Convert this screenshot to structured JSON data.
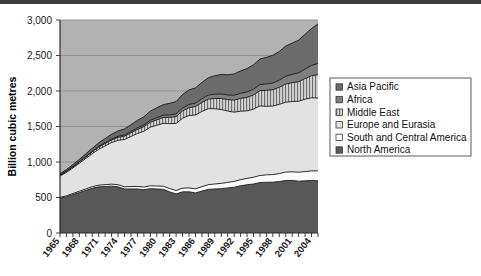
{
  "chart_data": {
    "type": "area",
    "stacked": true,
    "title": "",
    "xlabel": "",
    "ylabel": "Billion cubic metres",
    "ylim": [
      0,
      3000
    ],
    "ytick_labels": [
      "0",
      "500",
      "1,000",
      "1,500",
      "2,000",
      "2,500",
      "3,000"
    ],
    "ytick_values": [
      0,
      500,
      1000,
      1500,
      2000,
      2500,
      3000
    ],
    "grid": true,
    "legend_position": "right",
    "x": [
      1965,
      1966,
      1967,
      1968,
      1969,
      1970,
      1971,
      1972,
      1973,
      1974,
      1975,
      1976,
      1977,
      1978,
      1979,
      1980,
      1981,
      1982,
      1983,
      1984,
      1985,
      1986,
      1987,
      1988,
      1989,
      1990,
      1991,
      1992,
      1993,
      1994,
      1995,
      1996,
      1997,
      1998,
      1999,
      2000,
      2001,
      2002,
      2003,
      2004,
      2005
    ],
    "xtick_labels": [
      "1965",
      "1968",
      "1971",
      "1974",
      "1977",
      "1980",
      "1983",
      "1986",
      "1989",
      "1992",
      "1995",
      "1998",
      "2001",
      "2004"
    ],
    "series": [
      {
        "name": "North America",
        "fill": "#585858",
        "pattern": "solid",
        "values": [
          490,
          510,
          540,
          570,
          600,
          630,
          650,
          655,
          660,
          650,
          620,
          620,
          620,
          610,
          625,
          620,
          615,
          580,
          550,
          580,
          580,
          565,
          590,
          615,
          620,
          625,
          635,
          645,
          665,
          680,
          690,
          710,
          715,
          715,
          725,
          740,
          740,
          730,
          735,
          740,
          735
        ]
      },
      {
        "name": "South and Central America",
        "fill": "#fbfbfb",
        "pattern": "solid",
        "values": [
          12,
          14,
          16,
          18,
          20,
          22,
          24,
          26,
          28,
          30,
          32,
          34,
          36,
          38,
          40,
          42,
          44,
          46,
          48,
          52,
          55,
          58,
          62,
          66,
          70,
          74,
          78,
          82,
          86,
          90,
          95,
          100,
          104,
          108,
          112,
          118,
          122,
          126,
          130,
          135,
          140
        ]
      },
      {
        "name": "Europe and Eurasia",
        "fill": "#e2e2e2",
        "pattern": "solid",
        "values": [
          300,
          330,
          360,
          395,
          430,
          465,
          505,
          545,
          585,
          625,
          665,
          705,
          745,
          785,
          825,
          855,
          885,
          915,
          945,
          985,
          1020,
          1040,
          1060,
          1070,
          1060,
          1040,
          1005,
          975,
          965,
          950,
          960,
          980,
          965,
          965,
          975,
          985,
          990,
          1000,
          1020,
          1030,
          1025
        ]
      },
      {
        "name": "Middle East",
        "fill": "#c9c9c9",
        "pattern": "vertical-hatch",
        "values": [
          12,
          14,
          16,
          18,
          22,
          26,
          30,
          34,
          38,
          42,
          46,
          52,
          58,
          64,
          70,
          76,
          82,
          88,
          95,
          102,
          110,
          118,
          126,
          135,
          145,
          155,
          160,
          170,
          180,
          190,
          200,
          215,
          225,
          230,
          240,
          255,
          265,
          275,
          290,
          310,
          330
        ]
      },
      {
        "name": "Africa",
        "fill": "#7f7f7f",
        "pattern": "solid",
        "values": [
          3,
          4,
          5,
          6,
          7,
          8,
          10,
          12,
          14,
          16,
          18,
          20,
          22,
          25,
          28,
          30,
          32,
          35,
          38,
          42,
          45,
          48,
          52,
          56,
          60,
          64,
          66,
          68,
          72,
          76,
          80,
          85,
          90,
          95,
          100,
          110,
          118,
          125,
          135,
          145,
          160
        ]
      },
      {
        "name": "Asia Pacific",
        "fill": "#6b6b6b",
        "pattern": "solid",
        "values": [
          18,
          22,
          26,
          30,
          36,
          42,
          50,
          58,
          66,
          75,
          85,
          95,
          105,
          115,
          128,
          140,
          150,
          162,
          175,
          190,
          205,
          215,
          230,
          245,
          260,
          275,
          285,
          300,
          315,
          330,
          345,
          360,
          375,
          390,
          405,
          425,
          440,
          460,
          490,
          520,
          555
        ]
      }
    ]
  },
  "axis": {
    "y_title": "Billion cubic metres"
  },
  "legend": {
    "items": [
      {
        "label": "Asia Pacific",
        "swatch": "#6b6b6b"
      },
      {
        "label": "Africa",
        "swatch": "#7f7f7f"
      },
      {
        "label": "Middle East",
        "swatch": "#c9c9c9"
      },
      {
        "label": "Europe and Eurasia",
        "swatch": "#e2e2e2"
      },
      {
        "label": "South and Central America",
        "swatch": "#fbfbfb"
      },
      {
        "label": "North America",
        "swatch": "#585858"
      }
    ]
  }
}
